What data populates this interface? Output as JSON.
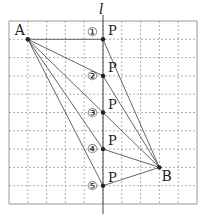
{
  "diagram": {
    "line_label": "l",
    "grid": {
      "cols": 10,
      "rows": 10,
      "origin": [
        9,
        21
      ],
      "cell": [
        18.8,
        18.3
      ]
    },
    "points": {
      "A": {
        "label": "A",
        "gx": 1,
        "gy": 1
      },
      "B": {
        "label": "B",
        "gx": 8,
        "gy": 8
      }
    },
    "p_positions": [
      {
        "id": "1",
        "marker": "①",
        "label": "P",
        "gx": 5,
        "gy": 1
      },
      {
        "id": "2",
        "marker": "②",
        "label": "P",
        "gx": 5,
        "gy": 3
      },
      {
        "id": "3",
        "marker": "③",
        "label": "P",
        "gx": 5,
        "gy": 5
      },
      {
        "id": "4",
        "marker": "④",
        "label": "P",
        "gx": 5,
        "gy": 7
      },
      {
        "id": "5",
        "marker": "⑤",
        "label": "P",
        "gx": 5,
        "gy": 9
      }
    ],
    "colors": {
      "grid": "#9a9a9a",
      "line": "#555555",
      "point": "#222222"
    }
  }
}
